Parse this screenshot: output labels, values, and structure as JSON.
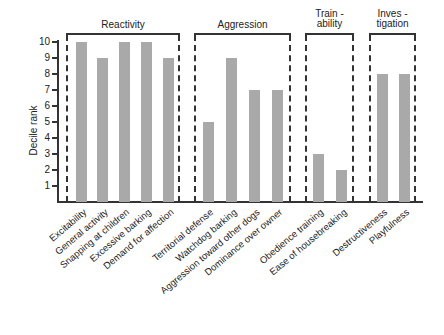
{
  "chart_data": {
    "type": "bar",
    "title": "",
    "xlabel": "",
    "ylabel": "Decile rank",
    "ylim": [
      0,
      10
    ],
    "yticks": [
      1,
      2,
      3,
      4,
      5,
      6,
      7,
      8,
      9,
      10
    ],
    "grid": false,
    "legend": null,
    "groups": [
      {
        "name": "Reactivity",
        "title_lines": [
          "Reactivity"
        ],
        "categories": [
          "Excitability",
          "General activity",
          "Snapping at children",
          "Excessive barking",
          "Demand for affection"
        ],
        "values": [
          10,
          9,
          10,
          10,
          9
        ]
      },
      {
        "name": "Aggression",
        "title_lines": [
          "Aggression"
        ],
        "categories": [
          "Territorial defense",
          "Watchdog barking",
          "Aggression toward other dogs",
          "Dominance over owner"
        ],
        "values": [
          5,
          9,
          7,
          7
        ]
      },
      {
        "name": "Trainability",
        "title_lines": [
          "Train -",
          "ability"
        ],
        "categories": [
          "Obedience training",
          "Ease of housebreaking"
        ],
        "values": [
          3,
          2
        ]
      },
      {
        "name": "Investigation",
        "title_lines": [
          "Inves -",
          "tigation"
        ],
        "categories": [
          "Destructiveness",
          "Playfulness"
        ],
        "values": [
          8,
          8
        ]
      }
    ],
    "categories": [
      "Excitability",
      "General activity",
      "Snapping at children",
      "Excessive barking",
      "Demand for affection",
      "Territorial defense",
      "Watchdog barking",
      "Aggression toward other dogs",
      "Dominance over owner",
      "Obedience training",
      "Ease of housebreaking",
      "Destructiveness",
      "Playfulness"
    ],
    "values": [
      10,
      9,
      10,
      10,
      9,
      5,
      9,
      7,
      7,
      3,
      2,
      8,
      8
    ],
    "bar_color": "#a9a9a9"
  }
}
